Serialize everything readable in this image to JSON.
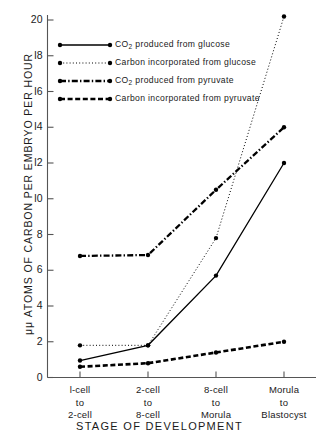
{
  "chart_data": {
    "type": "line",
    "title": "",
    "xlabel": "STAGE OF DEVELOPMENT",
    "ylabel": "μμ ATOMS OF CARBON PER EMBRYO PER HOUR",
    "categories": [
      "1-cell\nto\n2-cell",
      "2-cell\nto\n8-cell",
      "8-cell\nto\nMorula",
      "Morula\nto\nBlastocyst"
    ],
    "category_lines": [
      [
        "l-cell",
        "to",
        "2-cell"
      ],
      [
        "2-cell",
        "to",
        "8-cell"
      ],
      [
        "8-cell",
        "to",
        "Morula"
      ],
      [
        "Morula",
        "to",
        "Blastocyst"
      ]
    ],
    "ylim": [
      0,
      20.8
    ],
    "yticks": [
      0,
      2,
      4,
      6,
      8,
      10,
      12,
      14,
      16,
      18,
      20
    ],
    "ytick_labels": [
      "0",
      "2",
      "4",
      "6",
      "8",
      "l0",
      "l2",
      "l4",
      "l6",
      "l8",
      "20"
    ],
    "grid": false,
    "legend_position": "upper-left",
    "series": [
      {
        "name": "CO2 produced from glucose",
        "style": "solid",
        "color": "#000000",
        "values": [
          0.95,
          1.8,
          5.7,
          12.0
        ]
      },
      {
        "name": "Carbon incorporated from glucose",
        "style": "dotted",
        "color": "#000000",
        "values": [
          1.8,
          1.8,
          7.8,
          20.2
        ]
      },
      {
        "name": "CO2 produced from pyruvate",
        "style": "dash-dot",
        "color": "#000000",
        "values": [
          6.8,
          6.85,
          10.5,
          14.0
        ]
      },
      {
        "name": "Carbon incorporated from pyruvate",
        "style": "dashed",
        "color": "#000000",
        "values": [
          0.6,
          0.8,
          1.4,
          2.0
        ]
      }
    ]
  },
  "legend": {
    "entries": [
      {
        "prefix": "CO",
        "sub": "2",
        "suffix": " produced  from  glucose",
        "style": "solid"
      },
      {
        "prefix": "",
        "sub": "",
        "suffix": "Carbon  incorporated  from  glucose",
        "style": "dotted"
      },
      {
        "prefix": "CO",
        "sub": "2",
        "suffix": " produced  from  pyruvate",
        "style": "dash-dot"
      },
      {
        "prefix": "",
        "sub": "",
        "suffix": "Carbon  incorporated  from  pyruvate",
        "style": "dashed"
      }
    ]
  },
  "axes": {
    "y_title": "μμ  ATOMS  OF  CARBON  PER  EMBRYO  PER  HOUR",
    "x_title": "STAGE  OF  DEVELOPMENT"
  }
}
